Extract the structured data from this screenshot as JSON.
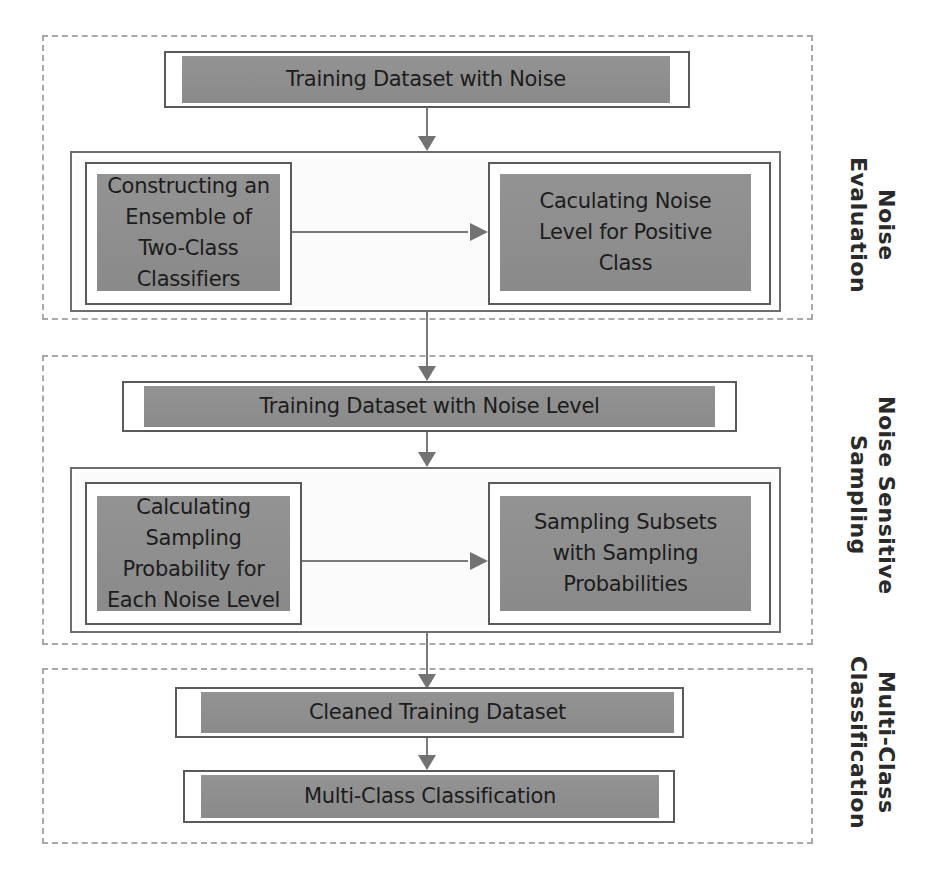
{
  "sections": [
    {
      "id": "noise-evaluation",
      "label": "Noise Evaluation",
      "label_lines": [
        "Noise",
        "Evaluation"
      ]
    },
    {
      "id": "noise-sensitive-sampling",
      "label": "Noise Sensitive Sampling",
      "label_lines": [
        "Noise Sensitive",
        "Sampling"
      ]
    },
    {
      "id": "multi-class-classification",
      "label": "Multi-Class Classification",
      "label_lines": [
        "Multi-Class",
        "Classification"
      ]
    }
  ],
  "nodes": {
    "training_noise": "Training Dataset with Noise",
    "ensemble": "Constructing an Ensemble of Two-Class Classifiers",
    "noise_level_calc": "Caculating Noise Level for Positive Class",
    "training_noise_level": "Training Dataset with Noise Level",
    "sampling_prob": "Calculating Sampling Probability for Each Noise Level",
    "sampling_subsets": "Sampling Subsets with Sampling Probabilities",
    "cleaned": "Cleaned Training Dataset",
    "multiclass": "Multi-Class Classification"
  },
  "edges": [
    {
      "from": "training_noise",
      "to": "noise_evaluation_group"
    },
    {
      "from": "ensemble",
      "to": "noise_level_calc"
    },
    {
      "from": "noise_evaluation_group",
      "to": "training_noise_level"
    },
    {
      "from": "training_noise_level",
      "to": "sampling_group"
    },
    {
      "from": "sampling_prob",
      "to": "sampling_subsets"
    },
    {
      "from": "sampling_group",
      "to": "cleaned"
    },
    {
      "from": "cleaned",
      "to": "multiclass"
    }
  ],
  "colors": {
    "node_fill": "#8f8f8f",
    "node_border": "#5a5a5a",
    "section_border": "#a9a9a9",
    "arrow": "#727272",
    "text": "#1c1c1c"
  }
}
